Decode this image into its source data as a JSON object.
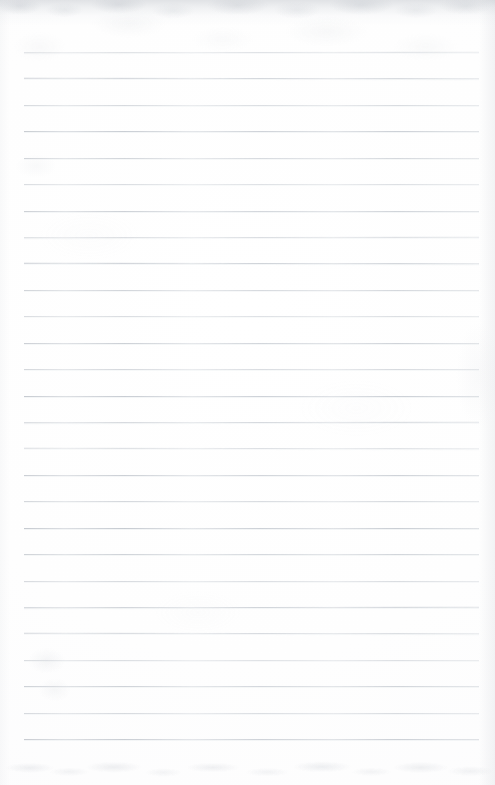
{
  "document": {
    "kind": "scanned-lined-paper",
    "title": "Blank ruled notebook page",
    "has_text_content": false,
    "page_number_visible": null,
    "width_px": 495,
    "height_px": 785
  },
  "paper": {
    "background_color": "#fefefe",
    "edge_shadow_color": "#b0b5bd",
    "smudge_color": "#c6cad1"
  },
  "ruling": {
    "line_color": "#c4c9d0",
    "line_count": 27,
    "line_thickness_px": 1,
    "first_line_y": 52,
    "line_spacing_px": 26.4,
    "line_left_x": 24,
    "line_right_x": 479,
    "lines_y": [
      52,
      78,
      105,
      131,
      158,
      184,
      211,
      237,
      263,
      290,
      316,
      343,
      369,
      396,
      422,
      448,
      475,
      501,
      528,
      554,
      581,
      607,
      633,
      660,
      686,
      713,
      739
    ]
  },
  "artifacts": {
    "top_shadow_band": {
      "y": 0,
      "height": 26
    },
    "bottom_smudge_band": {
      "y": 752,
      "height": 33
    },
    "left_blotch": {
      "x": 26,
      "y": 648
    }
  }
}
